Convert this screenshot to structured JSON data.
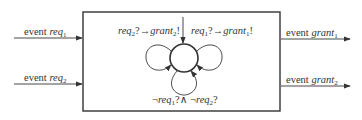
{
  "diagram": {
    "type": "state-machine-component",
    "inputs": [
      {
        "prefix": "event",
        "name": "req",
        "sub": "1"
      },
      {
        "prefix": "event",
        "name": "req",
        "sub": "2"
      }
    ],
    "outputs": [
      {
        "prefix": "event",
        "name": "grant",
        "sub": "1"
      },
      {
        "prefix": "event",
        "name": "grant",
        "sub": "2"
      }
    ],
    "transitions": {
      "left_loop": {
        "guard": "req",
        "guard_sub": "2",
        "guard_op": "?→",
        "action": "grant",
        "action_sub": "2",
        "action_op": "!"
      },
      "right_loop": {
        "guard": "req",
        "guard_sub": "1",
        "guard_op": "?→",
        "action": "grant",
        "action_sub": "1",
        "action_op": "!"
      },
      "bottom_loop": {
        "neg": "¬",
        "a": "req",
        "a_sub": "1",
        "op": "?∧ ",
        "b": "req",
        "b_sub": "2",
        "end": "?"
      }
    },
    "colors": {
      "stroke": "#333333",
      "background": "#ffffff"
    }
  }
}
